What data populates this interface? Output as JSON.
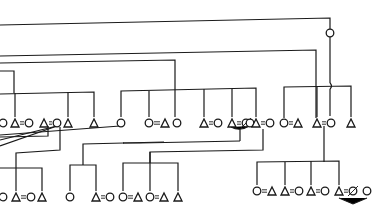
{
  "diagram": {
    "type": "kinship-genealogy",
    "legend_symbols": {
      "male": "triangle",
      "female": "circle",
      "marriage": "=",
      "deceased": "slashed-circle"
    },
    "colors": {
      "line": "#1a1a1a",
      "background": "#ffffff"
    },
    "generations": [
      {
        "level": 1,
        "row_y": 123,
        "individuals": [
          {
            "symbol": "circle",
            "x": 3
          },
          {
            "symbol": "triangle",
            "x": 15,
            "married_to": "circle@29"
          },
          {
            "symbol": "circle",
            "x": 29
          },
          {
            "symbol": "triangle",
            "x": 44,
            "married_to": "circle@57"
          },
          {
            "symbol": "circle",
            "x": 57
          },
          {
            "symbol": "triangle",
            "x": 68
          },
          {
            "symbol": "triangle",
            "x": 94
          },
          {
            "symbol": "circle",
            "x": 121
          },
          {
            "symbol": "circle",
            "x": 149,
            "married_to": "triangle@165"
          },
          {
            "symbol": "triangle",
            "x": 165
          },
          {
            "symbol": "circle",
            "x": 177
          },
          {
            "symbol": "triangle",
            "x": 204,
            "married_to": "circle@218"
          },
          {
            "symbol": "circle",
            "x": 218
          },
          {
            "symbol": "triangle",
            "x": 232,
            "married_to": "deceased@246"
          },
          {
            "symbol": "deceased",
            "x": 246
          },
          {
            "symbol": "circle",
            "x": 250
          },
          {
            "symbol": "triangle",
            "x": 256,
            "married_to": "circle@270"
          },
          {
            "symbol": "circle",
            "x": 270
          },
          {
            "symbol": "circle",
            "x": 284,
            "married_to": "triangle@298"
          },
          {
            "symbol": "triangle",
            "x": 298
          },
          {
            "symbol": "triangle",
            "x": 317,
            "married_to": "circle@331"
          },
          {
            "symbol": "circle",
            "x": 331
          },
          {
            "symbol": "triangle",
            "x": 351
          }
        ]
      },
      {
        "level": 2,
        "row_y": 197,
        "individuals": [
          {
            "symbol": "circle",
            "x": 3
          },
          {
            "symbol": "triangle",
            "x": 16,
            "married_to": "circle@31"
          },
          {
            "symbol": "circle",
            "x": 31
          },
          {
            "symbol": "triangle",
            "x": 42
          },
          {
            "symbol": "circle",
            "x": 70
          },
          {
            "symbol": "triangle",
            "x": 96,
            "married_to": "circle@110"
          },
          {
            "symbol": "circle",
            "x": 110
          },
          {
            "symbol": "circle",
            "x": 123,
            "married_to": "triangle@138"
          },
          {
            "symbol": "triangle",
            "x": 138
          },
          {
            "symbol": "circle",
            "x": 150,
            "married_to": "triangle@164"
          },
          {
            "symbol": "triangle",
            "x": 164
          },
          {
            "symbol": "triangle",
            "x": 178
          }
        ]
      },
      {
        "level": 3,
        "row_y": 191,
        "individuals": [
          {
            "symbol": "circle",
            "x": 257,
            "married_to": "triangle@272"
          },
          {
            "symbol": "triangle",
            "x": 272
          },
          {
            "symbol": "triangle",
            "x": 285,
            "married_to": "circle@299"
          },
          {
            "symbol": "circle",
            "x": 299
          },
          {
            "symbol": "triangle",
            "x": 311,
            "married_to": "circle@325"
          },
          {
            "symbol": "circle",
            "x": 325
          },
          {
            "symbol": "triangle",
            "x": 339,
            "married_to": "deceased@353"
          },
          {
            "symbol": "deceased",
            "x": 353
          },
          {
            "symbol": "circle",
            "x": 367
          }
        ]
      }
    ],
    "annotations": {
      "top_connector_circle": {
        "symbol": "circle",
        "x": 330,
        "y": 33
      }
    }
  }
}
